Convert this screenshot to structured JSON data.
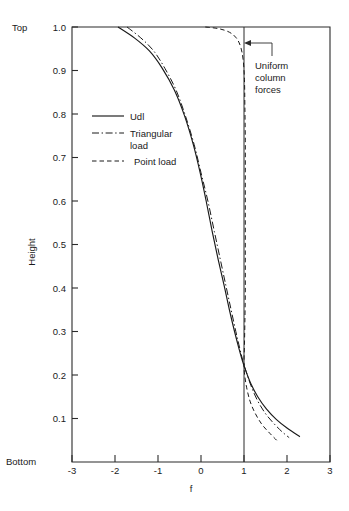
{
  "chart_data": {
    "type": "line",
    "title": "",
    "xlabel": "f",
    "ylabel": "Height",
    "xlim": [
      -3,
      3
    ],
    "ylim": [
      0,
      1.0
    ],
    "grid": false,
    "legend_position": "upper-left-inside",
    "x_ticks": [
      "-3",
      "-2",
      "-1",
      "0",
      "1",
      "2",
      "3"
    ],
    "x_tick_values": [
      -3,
      -2,
      -1,
      0,
      1,
      2,
      3
    ],
    "y_ticks": [
      "0.1",
      "0.2",
      "0.3",
      "0.4",
      "0.5",
      "0.6",
      "0.7",
      "0.8",
      "0.9",
      "1.0"
    ],
    "y_tick_values": [
      0.1,
      0.2,
      0.3,
      0.4,
      0.5,
      0.6,
      0.7,
      0.8,
      0.9,
      1.0
    ],
    "axis_end_labels": {
      "top": "Top",
      "bottom": "Bottom"
    },
    "annotations": [
      {
        "text_lines": [
          "Uniform",
          "column",
          "forces"
        ],
        "points_to_x": 1.0,
        "points_to_y": 0.965
      }
    ],
    "reference_lines": [
      {
        "name": "uniform-column-forces",
        "orientation": "vertical",
        "x": 1.0,
        "style": "solid"
      }
    ],
    "series": [
      {
        "name": "Udl",
        "style": "solid",
        "points": [
          [
            -1.93,
            1.0
          ],
          [
            -1.55,
            0.975
          ],
          [
            -1.2,
            0.945
          ],
          [
            -0.9,
            0.905
          ],
          [
            -0.62,
            0.855
          ],
          [
            -0.38,
            0.795
          ],
          [
            -0.18,
            0.73
          ],
          [
            -0.02,
            0.665
          ],
          [
            0.12,
            0.6
          ],
          [
            0.26,
            0.53
          ],
          [
            0.4,
            0.465
          ],
          [
            0.54,
            0.405
          ],
          [
            0.66,
            0.35
          ],
          [
            0.78,
            0.3
          ],
          [
            0.88,
            0.262
          ],
          [
            0.96,
            0.234
          ],
          [
            1.04,
            0.21
          ],
          [
            1.16,
            0.18
          ],
          [
            1.32,
            0.15
          ],
          [
            1.52,
            0.122
          ],
          [
            1.75,
            0.098
          ],
          [
            2.0,
            0.078
          ],
          [
            2.3,
            0.058
          ]
        ]
      },
      {
        "name": "Triangular load",
        "style": "dash-dot",
        "points": [
          [
            -1.72,
            1.0
          ],
          [
            -1.4,
            0.975
          ],
          [
            -1.1,
            0.945
          ],
          [
            -0.84,
            0.905
          ],
          [
            -0.58,
            0.855
          ],
          [
            -0.36,
            0.795
          ],
          [
            -0.16,
            0.73
          ],
          [
            0.0,
            0.665
          ],
          [
            0.16,
            0.6
          ],
          [
            0.31,
            0.53
          ],
          [
            0.45,
            0.465
          ],
          [
            0.58,
            0.405
          ],
          [
            0.7,
            0.35
          ],
          [
            0.81,
            0.3
          ],
          [
            0.9,
            0.262
          ],
          [
            0.97,
            0.234
          ],
          [
            1.05,
            0.208
          ],
          [
            1.16,
            0.176
          ],
          [
            1.3,
            0.144
          ],
          [
            1.48,
            0.114
          ],
          [
            1.68,
            0.09
          ],
          [
            1.88,
            0.07
          ],
          [
            2.05,
            0.056
          ]
        ]
      },
      {
        "name": "Point load",
        "style": "dashed",
        "points": [
          [
            0.1,
            1.0
          ],
          [
            0.42,
            0.996
          ],
          [
            0.66,
            0.988
          ],
          [
            0.82,
            0.975
          ],
          [
            0.92,
            0.955
          ],
          [
            0.98,
            0.925
          ],
          [
            1.01,
            0.88
          ],
          [
            1.02,
            0.82
          ],
          [
            1.03,
            0.74
          ],
          [
            1.03,
            0.65
          ],
          [
            1.03,
            0.56
          ],
          [
            1.03,
            0.47
          ],
          [
            1.03,
            0.39
          ],
          [
            1.02,
            0.32
          ],
          [
            1.01,
            0.268
          ],
          [
            1.0,
            0.234
          ],
          [
            1.01,
            0.205
          ],
          [
            1.06,
            0.172
          ],
          [
            1.14,
            0.14
          ],
          [
            1.26,
            0.112
          ],
          [
            1.42,
            0.086
          ],
          [
            1.6,
            0.066
          ],
          [
            1.76,
            0.05
          ]
        ]
      }
    ],
    "legend": [
      {
        "label": "Udl",
        "style": "solid"
      },
      {
        "label": "Triangular",
        "label2": "load",
        "style": "dash-dot"
      },
      {
        "label": "Point  load",
        "style": "dashed"
      }
    ]
  },
  "colors": {
    "ink": "#1a1a1a",
    "axis": "#2b2b2b",
    "background": "#ffffff"
  }
}
